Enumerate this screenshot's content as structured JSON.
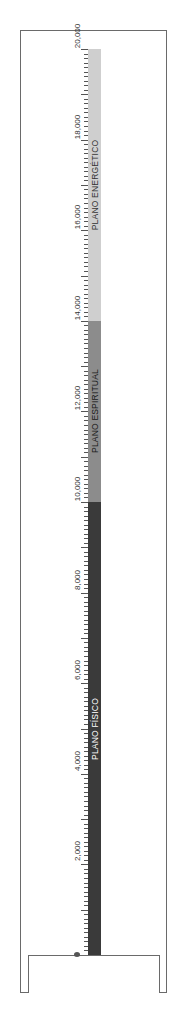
{
  "chart_data": {
    "type": "bar",
    "orientation": "vertical-stacked",
    "title": "",
    "xlabel": "",
    "ylabel": "",
    "ylim": [
      0,
      20000
    ],
    "major_tick_step": 1000,
    "minor_tick_step": 100,
    "tick_labels": [
      "0",
      "2,000",
      "4,000",
      "6,000",
      "8,000",
      "10,000",
      "12,000",
      "14,000",
      "16,000",
      "18,000",
      "20,000"
    ],
    "tick_values": [
      0,
      2000,
      4000,
      6000,
      8000,
      10000,
      12000,
      14000,
      16000,
      18000,
      20000
    ],
    "series": [
      {
        "name": "PLANO FÍSICO",
        "start": 0,
        "end": 10000,
        "color": "#3a3a3a",
        "label_color": "#ffffff"
      },
      {
        "name": "PLANO ESPIRITUAL",
        "start": 10000,
        "end": 14000,
        "color": "#8c8c8c",
        "label_color": "#1a1a1a"
      },
      {
        "name": "PLANO ENERGÉTICO",
        "start": 14000,
        "end": 20000,
        "color": "#cfcfcf",
        "label_color": "#333333"
      }
    ],
    "grid": false,
    "legend": "none"
  }
}
